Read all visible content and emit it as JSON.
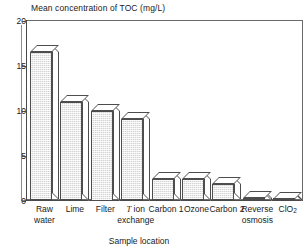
{
  "chart_data": {
    "type": "bar",
    "title": "Mean concentration of TOC (mg/L)",
    "xlabel": "Sample location",
    "ylabel": "",
    "ylim": [
      0,
      20
    ],
    "yticks": [
      0,
      5,
      10,
      15,
      20
    ],
    "grid": false,
    "legend": null,
    "style": "3d-extruded-hatched",
    "categories": [
      "Raw water",
      "Lime",
      "Filter",
      "T ion exchange",
      "Carbon 1",
      "Ozone",
      "Carbon 2",
      "Reverse osmosis",
      "ClO2"
    ],
    "category_labels_display": [
      "Raw\nwater",
      "Lime",
      "Filter",
      "T ion\nexchange",
      "Carbon 1",
      "Ozone",
      "Carbon 2",
      "Reverse\nosmosis",
      "ClO₂"
    ],
    "values": [
      16.5,
      11.0,
      10.0,
      9.1,
      2.4,
      2.4,
      1.8,
      0.3,
      0.2
    ],
    "units": "mg/L"
  },
  "axis": {
    "y_tick_labels": [
      "20",
      "15",
      "10",
      "5",
      "0"
    ],
    "x_axis_title": "Sample location"
  },
  "colors": {
    "bar_face": "#d3d3d3",
    "bar_outline": "#4d4d4d",
    "bar_top": "#ffffff",
    "axis": "#4a4a4a",
    "frame": "#6a6a6a",
    "text": "#1a1a1a",
    "background": "#ffffff"
  }
}
